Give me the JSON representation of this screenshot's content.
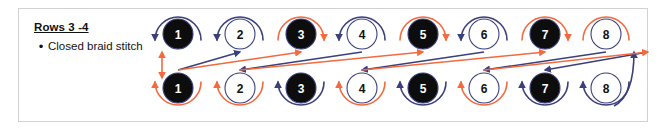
{
  "panel": {
    "border_color": "#d2d2d2",
    "background": "#ffffff"
  },
  "caption": {
    "title": "Rows 3 -4",
    "bullet_glyph": "•",
    "bullet_text": "Closed braid stitch"
  },
  "colors": {
    "thread_navy": "#3b3f7a",
    "thread_orange": "#f26a3d",
    "bead_fill_black": "#0d0d0d",
    "bead_fill_white": "#ffffff",
    "bead_stroke": "#3b3f7a",
    "bead_text_light": "#ffffff",
    "bead_text_dark": "#111111"
  },
  "diagram": {
    "type": "closed-braid-stitch",
    "rows": [
      {
        "name": "top-row",
        "row_label": "3",
        "beads": [
          {
            "label": "1",
            "fill": "black",
            "cx": 178,
            "cy": 34,
            "loop_color": "navy",
            "loop_arrow": "left"
          },
          {
            "label": "2",
            "fill": "white",
            "cx": 240,
            "cy": 34,
            "loop_color": "navy",
            "loop_arrow": "left"
          },
          {
            "label": "3",
            "fill": "black",
            "cx": 301,
            "cy": 34,
            "loop_color": "orange",
            "loop_arrow": "right"
          },
          {
            "label": "4",
            "fill": "white",
            "cx": 362,
            "cy": 34,
            "loop_color": "navy",
            "loop_arrow": "left"
          },
          {
            "label": "5",
            "fill": "black",
            "cx": 423,
            "cy": 34,
            "loop_color": "orange",
            "loop_arrow": "right"
          },
          {
            "label": "6",
            "fill": "white",
            "cx": 484,
            "cy": 34,
            "loop_color": "navy",
            "loop_arrow": "left"
          },
          {
            "label": "7",
            "fill": "black",
            "cx": 545,
            "cy": 34,
            "loop_color": "orange",
            "loop_arrow": "right"
          },
          {
            "label": "8",
            "fill": "white",
            "cx": 606,
            "cy": 34,
            "loop_color": "orange",
            "loop_arrow": "none"
          }
        ]
      },
      {
        "name": "bottom-row",
        "row_label": "4",
        "beads": [
          {
            "label": "1",
            "fill": "black",
            "cx": 178,
            "cy": 88,
            "loop_color": "orange",
            "loop_arrow": "up"
          },
          {
            "label": "2",
            "fill": "white",
            "cx": 240,
            "cy": 88,
            "loop_color": "orange",
            "loop_arrow": "up"
          },
          {
            "label": "3",
            "fill": "black",
            "cx": 301,
            "cy": 88,
            "loop_color": "navy",
            "loop_arrow": "up"
          },
          {
            "label": "4",
            "fill": "white",
            "cx": 362,
            "cy": 88,
            "loop_color": "orange",
            "loop_arrow": "up"
          },
          {
            "label": "5",
            "fill": "black",
            "cx": 423,
            "cy": 88,
            "loop_color": "navy",
            "loop_arrow": "up"
          },
          {
            "label": "6",
            "fill": "white",
            "cx": 484,
            "cy": 88,
            "loop_color": "orange",
            "loop_arrow": "up"
          },
          {
            "label": "7",
            "fill": "black",
            "cx": 545,
            "cy": 88,
            "loop_color": "navy",
            "loop_arrow": "up"
          },
          {
            "label": "8",
            "fill": "white",
            "cx": 606,
            "cy": 88,
            "loop_color": "navy",
            "loop_arrow": "up"
          }
        ]
      }
    ],
    "diagonals": [
      {
        "color": "navy",
        "from_x": 240,
        "from_y": 52,
        "to_x": 178,
        "to_y": 70,
        "arrow": "start"
      },
      {
        "color": "navy",
        "from_x": 362,
        "from_y": 52,
        "to_x": 240,
        "to_y": 70,
        "arrow": "end"
      },
      {
        "color": "navy",
        "from_x": 484,
        "from_y": 52,
        "to_x": 362,
        "to_y": 70,
        "arrow": "end"
      },
      {
        "color": "navy",
        "from_x": 606,
        "from_y": 52,
        "to_x": 484,
        "to_y": 70,
        "arrow": "end"
      },
      {
        "color": "navy",
        "from_x": 648,
        "from_y": 52,
        "to_x": 545,
        "to_y": 70,
        "arrow": "end"
      },
      {
        "color": "orange",
        "from_x": 178,
        "from_y": 70,
        "to_x": 301,
        "to_y": 52,
        "arrow": "end"
      },
      {
        "color": "orange",
        "from_x": 240,
        "from_y": 70,
        "to_x": 423,
        "to_y": 52,
        "arrow": "end"
      },
      {
        "color": "orange",
        "from_x": 362,
        "from_y": 70,
        "to_x": 545,
        "to_y": 52,
        "arrow": "end"
      },
      {
        "color": "orange",
        "from_x": 484,
        "from_y": 70,
        "to_x": 648,
        "to_y": 52,
        "arrow": "end"
      }
    ],
    "side_connector": {
      "color": "orange",
      "description": "vertical double-arrow thread at left edge",
      "x": 162,
      "y_top": 52,
      "y_bottom": 78
    },
    "right_connector": {
      "color": "navy",
      "description": "thread returning up the right edge to top bead 8",
      "x": 634
    }
  }
}
